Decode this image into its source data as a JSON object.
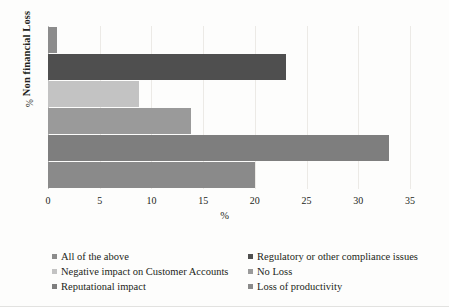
{
  "chart_data": {
    "type": "bar",
    "orientation": "horizontal",
    "title": "",
    "xlabel": "%",
    "ylabel": "Non financial Loss",
    "ylabel_unit": "%",
    "xlim": [
      0,
      35
    ],
    "xticks": [
      "0",
      "5",
      "10",
      "15",
      "20",
      "25",
      "30",
      "35"
    ],
    "grid": true,
    "legend_position": "bottom",
    "categories": [
      "All of the above",
      "Regulatory or other compliance issues",
      "Negative impact on Customer Accounts",
      "No Loss",
      "Reputational impact",
      "Loss of productivity"
    ],
    "values": [
      0.9,
      23.0,
      8.8,
      13.8,
      33.0,
      20.0
    ],
    "colors": [
      "#8c8c8c",
      "#4f4f4f",
      "#c3c3c3",
      "#9a9a9a",
      "#7e7e7e",
      "#8a8a8a"
    ]
  },
  "legend": {
    "rows": [
      {
        "left": "All of the above",
        "right": "Regulatory or other compliance issues"
      },
      {
        "left": "Negative impact on Customer Accounts",
        "right": "No Loss"
      },
      {
        "left": "Reputational impact",
        "right": "Loss of productivity"
      }
    ]
  }
}
